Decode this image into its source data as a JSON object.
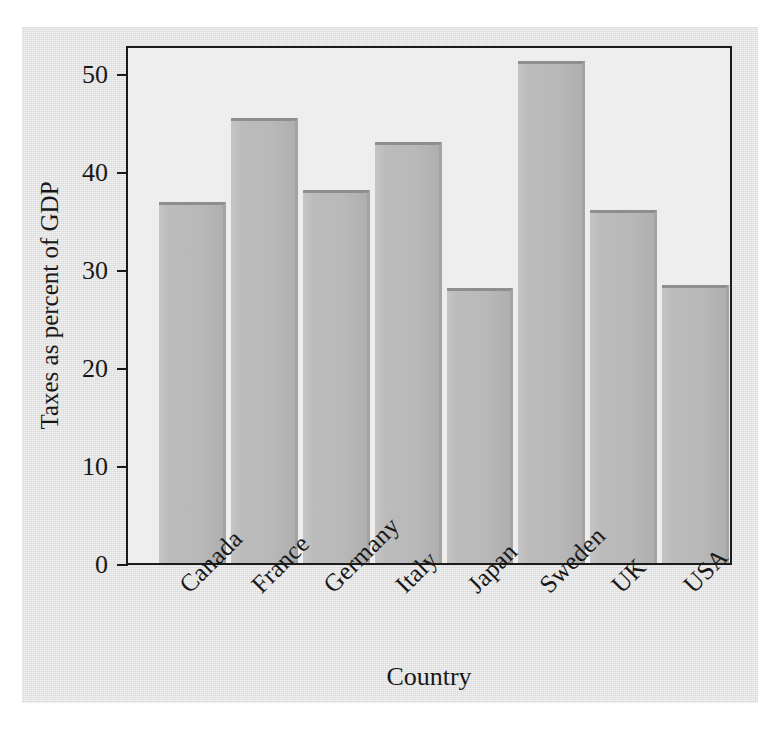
{
  "chart_data": {
    "type": "bar",
    "title": "",
    "xlabel": "Country",
    "ylabel": "Taxes as percent of GDP",
    "categories": [
      "Canada",
      "France",
      "Germany",
      "Italy",
      "Japan",
      "Sweden",
      "UK",
      "USA"
    ],
    "values": [
      36.9,
      45.4,
      38.1,
      43.0,
      28.1,
      51.3,
      36.1,
      28.4
    ],
    "ylim": [
      0,
      53
    ],
    "yticks": [
      0,
      10,
      20,
      30,
      40,
      50
    ],
    "ytick_labels": [
      "0",
      "10",
      "20",
      "30",
      "40",
      "50"
    ],
    "xtick_rotation": -45,
    "grid": false,
    "legend": "none",
    "bar_color": "#b9b9b9",
    "bar_edge_color": "#8e8e8e",
    "plot_background": "#eeeeee",
    "page_background": "#e1e1e1",
    "axis_color": "#1b1b1b"
  }
}
